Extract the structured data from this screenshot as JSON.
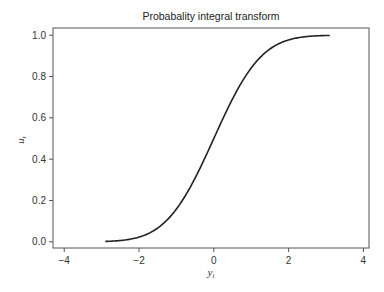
{
  "chart_data": {
    "type": "line",
    "title": "Probabality integral transform",
    "xlabel": "y_t",
    "ylabel": "u_t",
    "xlim": [
      -4.3,
      4.15
    ],
    "ylim": [
      -0.03,
      1.035
    ],
    "xticks": [
      -4,
      -2,
      0,
      2,
      4
    ],
    "xtick_labels": [
      "−4",
      "−2",
      "0",
      "2",
      "4"
    ],
    "yticks": [
      0.0,
      0.2,
      0.4,
      0.6,
      0.8,
      1.0
    ],
    "ytick_labels": [
      "0.0",
      "0.2",
      "0.4",
      "0.6",
      "0.8",
      "1.0"
    ],
    "grid": false,
    "legend": null,
    "series": [
      {
        "name": "Normal CDF",
        "color": "#222222",
        "x": [
          -2.9,
          -2.5,
          -2.0,
          -1.5,
          -1.0,
          -0.5,
          0.0,
          0.5,
          1.0,
          1.5,
          2.0,
          2.5,
          3.1
        ],
        "y": [
          0.002,
          0.006,
          0.023,
          0.067,
          0.159,
          0.309,
          0.5,
          0.691,
          0.841,
          0.933,
          0.977,
          0.994,
          0.999
        ]
      }
    ]
  }
}
